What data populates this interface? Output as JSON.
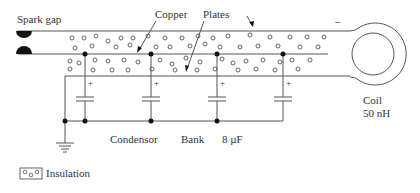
{
  "diagram": {
    "labels": {
      "spark_gap": "Spark gap",
      "copper": "Copper",
      "plates": "Plates",
      "minus": "–",
      "coil": "Coil",
      "coil_value": "50 nH",
      "condensor": "Condensor",
      "bank": "Bank",
      "capacitance": "8 µF",
      "plus": "+",
      "legend": "Insulation"
    },
    "capacitors": [
      {
        "x": 85,
        "polarity": "+"
      },
      {
        "x": 151,
        "polarity": "+"
      },
      {
        "x": 217,
        "polarity": "+"
      },
      {
        "x": 283,
        "polarity": "+"
      }
    ],
    "colors": {
      "line": "#555555",
      "text": "#333333",
      "dot": "#111111"
    }
  }
}
